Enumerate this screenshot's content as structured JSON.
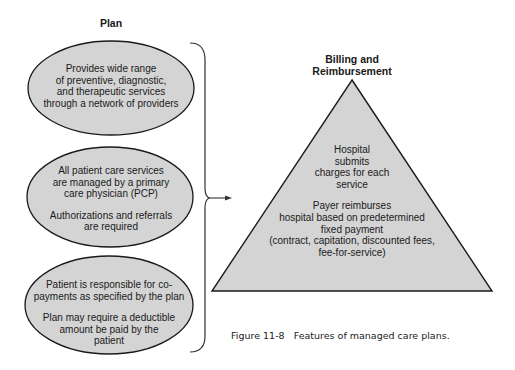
{
  "plan": {
    "heading": "Plan",
    "items": [
      {
        "lines": [
          "Provides wide range",
          "of preventive, diagnostic,",
          "and therapeutic services",
          "through a network of providers"
        ]
      },
      {
        "para1": [
          "All patient care services",
          "are managed by a primary",
          "care physician (PCP)"
        ],
        "para2": [
          "Authorizations and referrals",
          "are required"
        ]
      },
      {
        "para1": [
          "Patient is responsible for co-",
          "payments as specified by the plan"
        ],
        "para2": [
          "Plan may require a deductible",
          "amount be paid by the",
          "patient"
        ]
      }
    ]
  },
  "billing": {
    "heading_line1": "Billing and",
    "heading_line2": "Reimbursement",
    "para1": [
      "Hospital",
      "submits",
      "charges for each",
      "service"
    ],
    "para2": [
      "Payer reimburses",
      "hospital based on predetermined",
      "fixed payment",
      "(contract, capitation, discounted fees,",
      "fee-for-service)"
    ]
  },
  "caption": {
    "label": "Figure 11-8",
    "text": "Features of managed care plans."
  },
  "colors": {
    "shape_fill": "#d4d4d4",
    "stroke": "#1a1a1a"
  }
}
